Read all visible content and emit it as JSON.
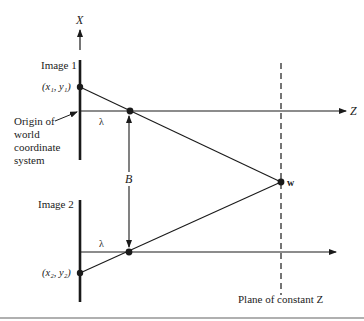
{
  "diagram": {
    "axes": {
      "x_axis_label": "X",
      "z_axis_label": "Z"
    },
    "labels": {
      "image1": "Image 1",
      "image2": "Image 2",
      "point1": "(x₁, y₁)",
      "point2": "(x₂, y₂)",
      "origin_line1": "Origin of",
      "origin_line2": "world",
      "origin_line3": "coordinate",
      "origin_line4": "system",
      "lambda_top": "λ",
      "lambda_bottom": "λ",
      "baseline": "B",
      "world_point": "w",
      "plane": "Plane of constant Z"
    },
    "colors": {
      "ink": "#1a1a1a",
      "background": "#ffffff",
      "bottom_rule": "#b0b0b0"
    }
  }
}
